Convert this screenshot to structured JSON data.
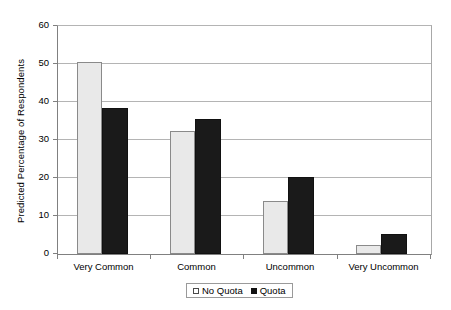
{
  "chart_data": {
    "type": "bar",
    "title": "",
    "subtitle": "",
    "xlabel": "",
    "ylabel": "Predicted Percentage of Respondents",
    "categories": [
      "Very Common",
      "Common",
      "Uncommon",
      "Very Uncommon"
    ],
    "series": [
      {
        "name": "No Quota",
        "values": [
          50.6,
          32.5,
          14.0,
          2.5
        ],
        "color": "#e9e9e9",
        "border_color": "#8a8a8a"
      },
      {
        "name": "Quota",
        "values": [
          38.5,
          35.5,
          20.3,
          5.3
        ],
        "color": "#1a1a1a",
        "border_color": "#111111"
      }
    ],
    "ylim": [
      0,
      60
    ],
    "yticks": [
      0,
      10,
      20,
      30,
      40,
      50,
      60
    ],
    "ytick_labels": [
      "0",
      "10",
      "20",
      "30",
      "40",
      "50",
      "60"
    ],
    "grid": true,
    "grid_axis": "y",
    "grid_color": "#b4b4b4",
    "legend": {
      "position": "bottom",
      "entries": [
        "No Quota",
        "Quota"
      ]
    },
    "background": "#ffffff",
    "axis_color": "#808080"
  }
}
